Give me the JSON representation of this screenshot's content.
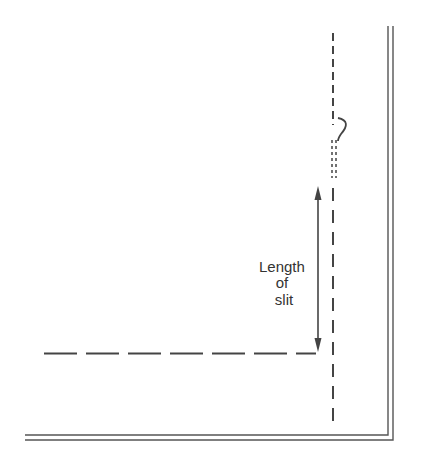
{
  "diagram": {
    "type": "sewing-pattern-detail",
    "annotation": {
      "lines": [
        "Length",
        "of",
        "slit"
      ]
    },
    "colors": {
      "ink": "#444444",
      "background": "#ffffff"
    },
    "elements": {
      "fold_line": "vertical dashed line",
      "cut_line": "horizontal dashed line ending at slit",
      "slit_dimension_arrow": "double-headed vertical arrow",
      "slit_mark": "short fine dashed segment with squiggle",
      "border": "double-line corner border (right and bottom)"
    }
  }
}
